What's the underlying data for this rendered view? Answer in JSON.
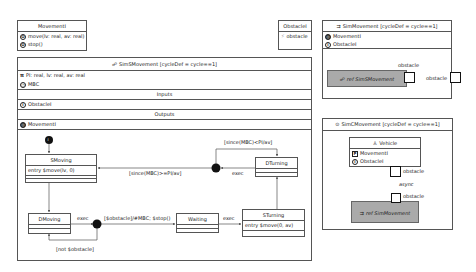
{
  "movement_interface": {
    "title": "MovementI",
    "operations": [
      "move(lv: real, av: real)",
      "stop()"
    ],
    "op_icon": "operation-icon"
  },
  "obstacle_interface": {
    "title": "ObstacleI",
    "events": [
      "obstacle"
    ],
    "event_icon": "event-icon"
  },
  "sim_s_movement": {
    "title": "SimSMovement [cycleDef = cycle==1]",
    "constants": "PI: real, lv: real, av: real",
    "clock": "MBC",
    "inputs_label": "Inputs",
    "inputs": [
      "ObstacleI"
    ],
    "outputs_label": "Outputs",
    "outputs": [
      "MovementI"
    ],
    "states": {
      "smoving": {
        "name": "SMoving",
        "action": "entry $move(lv, 0)"
      },
      "dturning": {
        "name": "DTurning"
      },
      "dmoving": {
        "name": "DMoving"
      },
      "waiting": {
        "name": "Waiting"
      },
      "sturning": {
        "name": "STurning",
        "action": "entry $move(0, av)"
      }
    },
    "transitions": {
      "dturning_guard_loop": "[since(MBC)<PI/av]",
      "to_smoving": "[since(MBC)>=PI/av]",
      "dturning_exec": "exec",
      "dmoving_exec": "exec",
      "obstacle_guard": "[$obstacle]/#MBC; $stop()",
      "not_obstacle": "[not $obstacle]",
      "waiting_exec": "exec"
    },
    "initial_label": "i"
  },
  "sim_movement": {
    "title": "SimMovement [cycleDef = cycle==1]",
    "outputs": [
      "MovementI"
    ],
    "inputs": [
      "ObstacleI"
    ],
    "ref_label": "ref SimSMovement",
    "inner_port_label": "obstacle",
    "outer_port_label": "obstacle"
  },
  "sim_c_movement": {
    "title": "SimCMovement [cycleDef = cycle==1]",
    "vehicle": {
      "title": "Vehicle",
      "provided": "MovementI",
      "input": "ObstacleI"
    },
    "vehicle_port_label": "obstacle",
    "connection_label": "async",
    "ref_port_label": "obstacle",
    "ref_label": "ref SimMovement"
  }
}
